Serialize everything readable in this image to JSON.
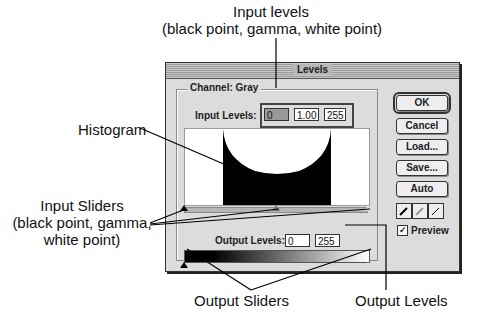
{
  "callouts": {
    "input_levels": {
      "line1": "Input levels",
      "line2": "(black point, gamma, white point)"
    },
    "histogram": "Histogram",
    "input_sliders": {
      "line1": "Input Sliders",
      "line2": "(black point, gamma,",
      "line3": "white point)"
    },
    "output_sliders": "Output Sliders",
    "output_levels": "Output Levels"
  },
  "dialog": {
    "title": "Levels",
    "channel_label": "Channel: Gray",
    "input_levels_label": "Input Levels:",
    "input_levels": {
      "black": "0",
      "gamma": "1.00",
      "white": "255"
    },
    "output_levels_label": "Output Levels:",
    "output_levels": {
      "black": "0",
      "white": "255"
    },
    "buttons": {
      "ok": "OK",
      "cancel": "Cancel",
      "load": "Load...",
      "save": "Save...",
      "auto": "Auto"
    },
    "preview_label": "Preview",
    "preview_checked": "✓"
  }
}
